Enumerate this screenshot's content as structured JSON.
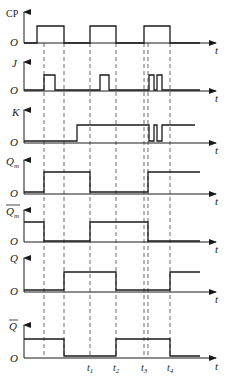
{
  "diagram": {
    "type": "timing-diagram",
    "title": "",
    "axis_origin_label": "O",
    "axis_time_label": "t",
    "signals": [
      {
        "id": "CP",
        "label": "CP",
        "overline": false,
        "italic": false
      },
      {
        "id": "J",
        "label": "J",
        "overline": false,
        "italic": true
      },
      {
        "id": "K",
        "label": "K",
        "overline": false,
        "italic": true
      },
      {
        "id": "Qm",
        "label": "Q",
        "subscript": "m",
        "overline": false,
        "italic": true
      },
      {
        "id": "Qm_bar",
        "label": "Q",
        "subscript": "m",
        "overline": true,
        "italic": true
      },
      {
        "id": "Q",
        "label": "Q",
        "overline": false,
        "italic": true
      },
      {
        "id": "Q_bar",
        "label": "Q",
        "overline": true,
        "italic": true
      }
    ],
    "time_markers": [
      {
        "label": "t",
        "subscript": "1"
      },
      {
        "label": "t",
        "subscript": "2"
      },
      {
        "label": "t",
        "subscript": "3"
      },
      {
        "label": "t",
        "subscript": "4"
      }
    ],
    "waveforms": {
      "CP": "low→high at x37, high→low at x64, low→high at x90, high→low at x116, low→high at x144, high→low at x170",
      "J": "pulses at 44–55, 100–109, 149–154, 157–162",
      "K": "high from x77 onward, with dips at 149–154 and 157–162",
      "Qm": "low until 44, high 44–90, low 90–148, high from 148",
      "Qm_bar": "high until 44, low 44–90, high 90–148, low from 148",
      "Q": "low until 64, high 64–116, low 116–170, high from 170",
      "Q_bar": "high until 64, low 64–116, high 116–170, low from 170"
    }
  }
}
